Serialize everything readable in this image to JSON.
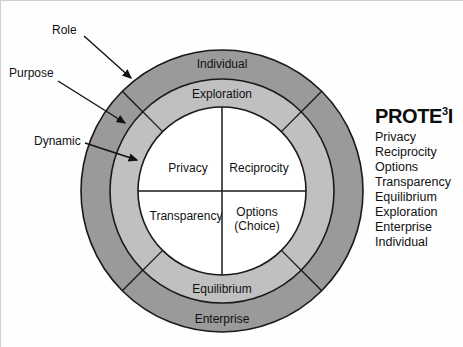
{
  "diagram": {
    "title_heading": "PROTE",
    "title_superscript": "3",
    "title_tail": "I",
    "colors": {
      "outer_ring": "#9a9a9a",
      "middle_ring": "#c0c0c0",
      "inner_circle": "#ffffff",
      "stroke": "#1a1a1a",
      "text": "#111111",
      "background": "#fefefe"
    },
    "outer_ring": {
      "top_label": "Individual",
      "bottom_label": "Enterprise"
    },
    "middle_ring": {
      "top_label": "Exploration",
      "bottom_label": "Equilibrium"
    },
    "inner_quadrants": [
      {
        "id": "top-left",
        "label": "Privacy"
      },
      {
        "id": "top-right",
        "label": "Reciprocity"
      },
      {
        "id": "bottom-left",
        "label": "Transparency"
      },
      {
        "id": "bottom-right",
        "label": "Options",
        "label_line2": "(Choice)"
      }
    ],
    "callouts": [
      {
        "id": "role",
        "label": "Role"
      },
      {
        "id": "purpose",
        "label": "Purpose"
      },
      {
        "id": "dynamic",
        "label": "Dynamic"
      }
    ]
  },
  "legend": {
    "title": "PROTE3I",
    "items": [
      "Privacy",
      "Reciprocity",
      "Options",
      "Transparency",
      "Equilibrium",
      "Exploration",
      "Enterprise",
      "Individual"
    ]
  }
}
